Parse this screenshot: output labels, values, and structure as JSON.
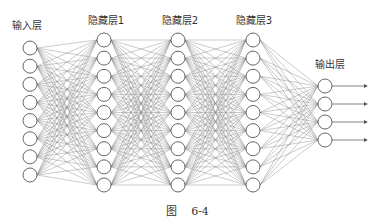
{
  "figure": {
    "caption_prefix": "图",
    "caption_number": "6-4"
  },
  "colors": {
    "edge": "#8a8a8a",
    "node_stroke": "#555555",
    "node_fill": "#ffffff",
    "text": "#333333"
  },
  "network": {
    "node_radius": 7,
    "layers": [
      {
        "name": "input",
        "label": "输入层",
        "x": 30,
        "nodes": 8,
        "y_start": 48,
        "y_end": 175,
        "label_x": 27,
        "label_y": 17
      },
      {
        "name": "hidden1",
        "label": "隐藏层1",
        "x": 104,
        "nodes": 9,
        "y_start": 40,
        "y_end": 185,
        "label_x": 106,
        "label_y": 12
      },
      {
        "name": "hidden2",
        "label": "隐藏层2",
        "x": 178,
        "nodes": 9,
        "y_start": 40,
        "y_end": 185,
        "label_x": 180,
        "label_y": 12
      },
      {
        "name": "hidden3",
        "label": "隐藏层3",
        "x": 253,
        "nodes": 9,
        "y_start": 40,
        "y_end": 185,
        "label_x": 254,
        "label_y": 12
      },
      {
        "name": "output",
        "label": "输出层",
        "x": 325,
        "nodes": 4,
        "y_start": 86,
        "y_end": 140,
        "label_x": 330,
        "label_y": 56
      }
    ],
    "output_arrows": {
      "length": 35
    }
  },
  "labels": {
    "input": "输入层",
    "hidden1": "隐藏层1",
    "hidden2": "隐藏层2",
    "hidden3": "隐藏层3",
    "output": "输出层"
  }
}
